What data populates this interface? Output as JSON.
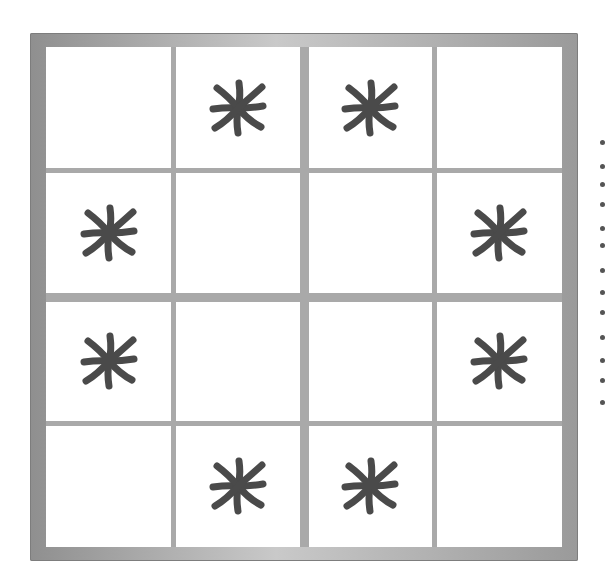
{
  "puzzle": {
    "size": 4,
    "box_size": 2,
    "symbol_icon": "asterisk-icon",
    "symbol_color": "#4a4a4a",
    "frame_color": "#a0a0a0",
    "cells": [
      [
        0,
        1,
        1,
        0
      ],
      [
        1,
        0,
        0,
        1
      ],
      [
        1,
        0,
        0,
        1
      ],
      [
        0,
        1,
        1,
        0
      ]
    ]
  }
}
